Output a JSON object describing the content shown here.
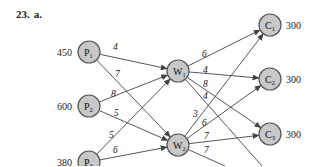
{
  "problem": {
    "number": "23.",
    "part": "a."
  },
  "nodes": [
    {
      "id": "P1",
      "letter": "P",
      "sub": "1",
      "x": 89,
      "y": 52,
      "value": "450",
      "value_side": "left"
    },
    {
      "id": "P2",
      "letter": "P",
      "sub": "2",
      "x": 89,
      "y": 106,
      "value": "600",
      "value_side": "left"
    },
    {
      "id": "P3",
      "letter": "P",
      "sub": "3",
      "x": 89,
      "y": 162,
      "value": "380",
      "value_side": "left"
    },
    {
      "id": "W1",
      "letter": "W",
      "sub": "1",
      "x": 178,
      "y": 71,
      "value": "",
      "value_side": "none"
    },
    {
      "id": "W2",
      "letter": "W",
      "sub": "2",
      "x": 178,
      "y": 145,
      "value": "",
      "value_side": "none"
    },
    {
      "id": "C1",
      "letter": "C",
      "sub": "1",
      "x": 270,
      "y": 25,
      "value": "300",
      "value_side": "right"
    },
    {
      "id": "C2",
      "letter": "C",
      "sub": "2",
      "x": 270,
      "y": 79,
      "value": "300",
      "value_side": "right"
    },
    {
      "id": "C3",
      "letter": "C",
      "sub": "3",
      "x": 270,
      "y": 134,
      "value": "300",
      "value_side": "right"
    }
  ],
  "edges": [
    {
      "from": "P1",
      "to": "W1",
      "label": "4",
      "lx": 113,
      "ly": 50
    },
    {
      "from": "P1",
      "to": "W2",
      "label": "7",
      "lx": 115,
      "ly": 77
    },
    {
      "from": "P2",
      "to": "W1",
      "label": "8",
      "lx": 111,
      "ly": 97
    },
    {
      "from": "P2",
      "to": "W2",
      "label": "5",
      "lx": 114,
      "ly": 116
    },
    {
      "from": "P3",
      "to": "W1",
      "label": "5",
      "lx": 109,
      "ly": 138
    },
    {
      "from": "P3",
      "to": "W2",
      "label": "6",
      "lx": 113,
      "ly": 153
    },
    {
      "from": "W1",
      "to": "C1",
      "label": "6",
      "lx": 202,
      "ly": 57
    },
    {
      "from": "W1",
      "to": "C2",
      "label": "4",
      "lx": 203,
      "ly": 73
    },
    {
      "from": "W1",
      "to": "C3",
      "label": "8",
      "lx": 203,
      "ly": 87
    },
    {
      "from": "W1",
      "to": "C4",
      "label": "4",
      "lx": 203,
      "ly": 99,
      "offscreen": true,
      "ex": 262,
      "ey": 166
    },
    {
      "from": "W2",
      "to": "C1",
      "label": "3",
      "lx": 193,
      "ly": 117
    },
    {
      "from": "W2",
      "to": "C2",
      "label": "6",
      "lx": 202,
      "ly": 126
    },
    {
      "from": "W2",
      "to": "C3",
      "label": "7",
      "lx": 204,
      "ly": 139
    },
    {
      "from": "W2",
      "to": "C4",
      "label": "7",
      "lx": 204,
      "ly": 153,
      "offscreen": true,
      "ex": 225,
      "ey": 166
    }
  ],
  "colors": {
    "node_fill": "#c8c8c8",
    "node_stroke": "#555555",
    "edge": "#444444"
  }
}
